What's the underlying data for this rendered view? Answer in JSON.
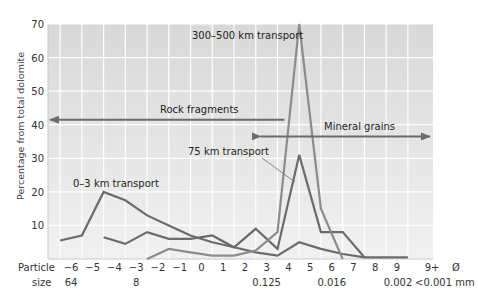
{
  "chart_data": {
    "type": "line",
    "title": "",
    "ylabel": "Percentage from total dolomite",
    "xlabel_lines": [
      "Particle",
      "size"
    ],
    "ylim": [
      0,
      70
    ],
    "yticks": [
      10,
      20,
      30,
      40,
      50,
      60,
      70
    ],
    "xticks_phi": [
      "−6",
      "−5",
      "−4",
      "−3",
      "−2",
      "−1",
      "0",
      "1",
      "2",
      "3",
      "4",
      "5",
      "6",
      "7",
      "8",
      "9",
      "9+",
      "Ø"
    ],
    "xticks_mm": [
      {
        "at": "−6",
        "label": "64"
      },
      {
        "at": "−3",
        "label": "8"
      },
      {
        "at": "3",
        "label": "0.125"
      },
      {
        "at": "6",
        "label": "0.016"
      },
      {
        "at": "9",
        "label": "0.002"
      },
      {
        "at": "9+",
        "label": "<0.001 mm"
      }
    ],
    "grid": true,
    "series": [
      {
        "name": "0–3 km transport",
        "color": "#6b6b6b",
        "points": [
          [
            -6.5,
            5.5
          ],
          [
            -5.5,
            7
          ],
          [
            -4.5,
            20
          ],
          [
            -3.5,
            17.5
          ],
          [
            -2.5,
            13
          ],
          [
            -1.5,
            10
          ],
          [
            -0.5,
            7
          ],
          [
            0.5,
            5
          ],
          [
            1.5,
            3.5
          ],
          [
            2.5,
            2
          ],
          [
            3.5,
            1
          ],
          [
            4.5,
            5
          ],
          [
            5.5,
            3
          ],
          [
            6.5,
            1.5
          ],
          [
            7.5,
            0.5
          ],
          [
            9.5,
            0.5
          ]
        ]
      },
      {
        "name": "75 km transport",
        "color": "#6b6b6b",
        "points": [
          [
            -4.5,
            6.5
          ],
          [
            -3.5,
            4.5
          ],
          [
            -2.5,
            8
          ],
          [
            -1.5,
            6
          ],
          [
            -0.5,
            6
          ],
          [
            0.5,
            7
          ],
          [
            1.5,
            3.5
          ],
          [
            2.5,
            9
          ],
          [
            3.5,
            3
          ],
          [
            4.5,
            31
          ],
          [
            5.5,
            8
          ],
          [
            6.5,
            8
          ],
          [
            7.5,
            0.5
          ]
        ]
      },
      {
        "name": "300–500 km transport",
        "color": "#8c8c8c",
        "points": [
          [
            -2.5,
            0
          ],
          [
            -1.5,
            3
          ],
          [
            -0.5,
            2
          ],
          [
            0.5,
            1
          ],
          [
            1.5,
            1
          ],
          [
            2.5,
            2.5
          ],
          [
            3.5,
            8
          ],
          [
            4.5,
            70
          ],
          [
            5.5,
            15
          ],
          [
            6.5,
            0
          ]
        ]
      }
    ],
    "annotations": [
      {
        "text": "Rock fragments",
        "type": "arrow-left",
        "from_phi": 4,
        "to_phi": -7,
        "y": 41.5
      },
      {
        "text": "Mineral grains",
        "type": "arrow-right",
        "from_phi": 3,
        "to_phi": 9.9,
        "y": 36.5
      }
    ]
  }
}
